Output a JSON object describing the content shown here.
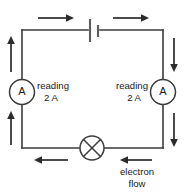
{
  "diagram": {
    "type": "electric-circuit",
    "components": {
      "battery": {
        "name": "battery",
        "position": "top-center"
      },
      "lamp": {
        "name": "lamp",
        "symbol": "crossed-circle",
        "position": "bottom-center"
      },
      "ammeter_left": {
        "name": "ammeter",
        "symbol_label": "A",
        "position": "left-side",
        "reading_label": "reading",
        "reading_value": "2 A"
      },
      "ammeter_right": {
        "name": "ammeter",
        "symbol_label": "A",
        "position": "right-side",
        "reading_label": "reading",
        "reading_value": "2 A"
      }
    },
    "annotations": {
      "electron_flow_line1": "electron",
      "electron_flow_line2": "flow"
    },
    "arrows": [
      {
        "id": "top-left",
        "direction": "right"
      },
      {
        "id": "top-right",
        "direction": "right"
      },
      {
        "id": "left-upper",
        "direction": "up"
      },
      {
        "id": "left-lower",
        "direction": "up"
      },
      {
        "id": "right-upper",
        "direction": "down"
      },
      {
        "id": "right-lower",
        "direction": "down"
      },
      {
        "id": "bottom-left",
        "direction": "left"
      },
      {
        "id": "bottom-right",
        "direction": "left"
      }
    ],
    "colors": {
      "wire": "#3b3b3b",
      "arrow": "#2b2b2b",
      "text": "#1a1a1a",
      "background": "#ffffff"
    }
  }
}
